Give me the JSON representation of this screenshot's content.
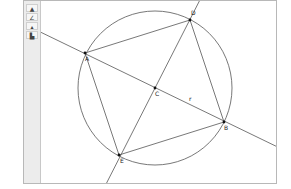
{
  "toolbar": {
    "tools": [
      {
        "name": "point-tool",
        "glyph": "▲"
      },
      {
        "name": "line-tool",
        "glyph": "∠"
      },
      {
        "name": "compass-tool",
        "glyph": "▴"
      },
      {
        "name": "text-tool",
        "glyph": "▙"
      }
    ]
  },
  "canvas": {
    "points": [
      {
        "id": "A",
        "label": "A",
        "x": 85,
        "y": 53
      },
      {
        "id": "D",
        "label": "D",
        "x": 190,
        "y": 20
      },
      {
        "id": "C",
        "label": "C",
        "x": 155,
        "y": 88
      },
      {
        "id": "B",
        "label": "B",
        "x": 224,
        "y": 122
      },
      {
        "id": "E",
        "label": "E",
        "x": 119,
        "y": 155
      }
    ],
    "line_label": "r",
    "circle": {
      "cx": 155,
      "cy": 88,
      "r": 77
    }
  },
  "colors": {
    "stroke": "#555555",
    "frame": "#b8b8b8",
    "toolbar_bg": "#ececec"
  }
}
